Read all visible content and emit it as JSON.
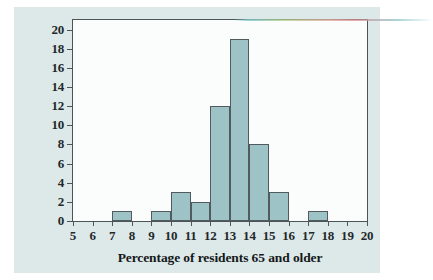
{
  "chart_data": {
    "type": "bar",
    "title": "",
    "subtitle": "",
    "xlabel": "Percentage of residents 65 and older",
    "ylabel": "Number of states",
    "xlim": [
      5,
      20
    ],
    "ylim": [
      0,
      21
    ],
    "xticks": [
      5,
      6,
      7,
      8,
      9,
      10,
      11,
      12,
      13,
      14,
      15,
      16,
      17,
      18,
      19,
      20
    ],
    "yticks": [
      0,
      2,
      4,
      6,
      8,
      10,
      12,
      14,
      16,
      18,
      20
    ],
    "grid": false,
    "legend": null,
    "bin_width": 1,
    "bins": [
      {
        "start": 5,
        "end": 6,
        "count": 0
      },
      {
        "start": 6,
        "end": 7,
        "count": 0
      },
      {
        "start": 7,
        "end": 8,
        "count": 1
      },
      {
        "start": 8,
        "end": 9,
        "count": 0
      },
      {
        "start": 9,
        "end": 10,
        "count": 1
      },
      {
        "start": 10,
        "end": 11,
        "count": 3
      },
      {
        "start": 11,
        "end": 12,
        "count": 2
      },
      {
        "start": 12,
        "end": 13,
        "count": 12
      },
      {
        "start": 13,
        "end": 14,
        "count": 19
      },
      {
        "start": 14,
        "end": 15,
        "count": 8
      },
      {
        "start": 15,
        "end": 16,
        "count": 3
      },
      {
        "start": 16,
        "end": 17,
        "count": 0
      },
      {
        "start": 17,
        "end": 18,
        "count": 1
      },
      {
        "start": 18,
        "end": 19,
        "count": 0
      },
      {
        "start": 19,
        "end": 20,
        "count": 0
      }
    ],
    "categories": [
      "5-6",
      "6-7",
      "7-8",
      "8-9",
      "9-10",
      "10-11",
      "11-12",
      "12-13",
      "13-14",
      "14-15",
      "15-16",
      "16-17",
      "17-18",
      "18-19",
      "19-20"
    ],
    "values": [
      0,
      0,
      1,
      0,
      1,
      3,
      2,
      12,
      19,
      8,
      3,
      0,
      1,
      0,
      0
    ],
    "colors": {
      "bar_fill": "#9dc3c7",
      "bar_edge": "#515b5e",
      "axis": "#4b5558",
      "figure_background": "#dde8e9",
      "plot_background": "#fbfdfd",
      "text": "#14181a"
    }
  }
}
